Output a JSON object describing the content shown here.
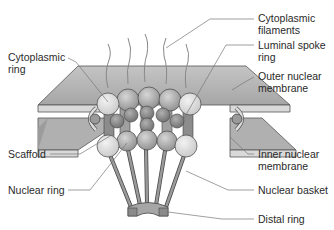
{
  "diagram": {
    "labels_left": [
      {
        "id": "cytoplasmic-ring",
        "text": "Cytoplasmic\nring"
      },
      {
        "id": "scaffold",
        "text": "Scaffold"
      },
      {
        "id": "nuclear-ring",
        "text": "Nuclear ring"
      }
    ],
    "labels_right": [
      {
        "id": "cytoplasmic-filaments",
        "text": "Cytoplasmic\nfilaments"
      },
      {
        "id": "luminal-spoke-ring",
        "text": "Luminal spoke\nring"
      },
      {
        "id": "outer-nuclear-membrane",
        "text": "Outer nuclear\nmembrane"
      },
      {
        "id": "inner-nuclear-membrane",
        "text": "Inner nuclear\nmembrane"
      },
      {
        "id": "nuclear-basket",
        "text": "Nuclear basket"
      },
      {
        "id": "distal-ring",
        "text": "Distal ring"
      }
    ],
    "colors": {
      "membrane_top": "#b4b4b4",
      "membrane_edge": "#8a8a8a",
      "sphere_light": "#dcdcdc",
      "sphere_mid": "#a8a8a8",
      "sphere_dark": "#8c8c8c",
      "leader_line": "#707070",
      "outline": "#444444"
    }
  }
}
